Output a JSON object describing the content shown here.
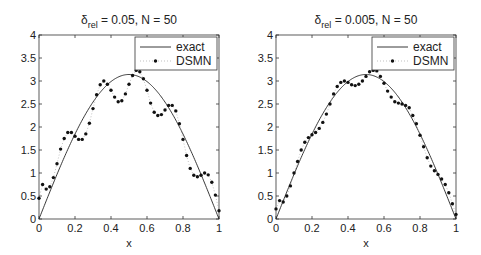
{
  "chart_data": [
    {
      "type": "line",
      "title": "δ_rel = 0.05, N = 50",
      "title_main": "δ",
      "title_sub": "rel",
      "title_rest": " = 0.05, N = 50",
      "xlabel": "x",
      "ylabel": "",
      "xlim": [
        0,
        1
      ],
      "ylim": [
        0,
        4
      ],
      "xticks": [
        "0",
        "0.2",
        "0.4",
        "0.6",
        "0.8",
        "1"
      ],
      "yticks": [
        "0",
        "0.5",
        "1",
        "1.5",
        "2",
        "2.5",
        "3",
        "3.5",
        "4"
      ],
      "grid": false,
      "legend": {
        "position": "upper right",
        "entries": [
          "exact",
          "DSMN"
        ]
      },
      "x": [
        0,
        0.02,
        0.04,
        0.06,
        0.08,
        0.1,
        0.12,
        0.14,
        0.16,
        0.18,
        0.2,
        0.22,
        0.24,
        0.26,
        0.28,
        0.3,
        0.32,
        0.34,
        0.36,
        0.38,
        0.4,
        0.42,
        0.44,
        0.46,
        0.48,
        0.5,
        0.52,
        0.54,
        0.56,
        0.58,
        0.6,
        0.62,
        0.64,
        0.66,
        0.68,
        0.7,
        0.72,
        0.74,
        0.76,
        0.78,
        0.8,
        0.82,
        0.84,
        0.86,
        0.88,
        0.9,
        0.92,
        0.94,
        0.96,
        0.98,
        1.0
      ],
      "series": [
        {
          "name": "exact",
          "style": "solid line",
          "function": "pi*sin(pi*x)",
          "peak": 3.14
        },
        {
          "name": "DSMN",
          "style": "dotted with dot markers",
          "values": [
            0.45,
            0.75,
            0.65,
            0.7,
            0.9,
            1.2,
            1.52,
            1.75,
            1.88,
            1.88,
            1.8,
            1.73,
            1.73,
            1.85,
            2.08,
            2.4,
            2.7,
            2.92,
            3.0,
            2.93,
            2.8,
            2.65,
            2.55,
            2.57,
            2.72,
            2.93,
            3.12,
            3.23,
            3.2,
            3.05,
            2.8,
            2.52,
            2.32,
            2.25,
            2.27,
            2.37,
            2.47,
            2.47,
            2.35,
            2.07,
            1.73,
            1.38,
            1.1,
            0.95,
            0.92,
            0.95,
            1.0,
            0.96,
            0.8,
            0.52,
            0.18
          ]
        }
      ]
    },
    {
      "type": "line",
      "title": "δ_rel = 0.005, N = 50",
      "title_main": "δ",
      "title_sub": "rel",
      "title_rest": " = 0.005, N = 50",
      "xlabel": "x",
      "ylabel": "",
      "xlim": [
        0,
        1
      ],
      "ylim": [
        0,
        4
      ],
      "xticks": [
        "0",
        "0.2",
        "0.4",
        "0.6",
        "0.8",
        "1"
      ],
      "yticks": [
        "0",
        "0.5",
        "1",
        "1.5",
        "2",
        "2.5",
        "3",
        "3.5",
        "4"
      ],
      "grid": false,
      "legend": {
        "position": "upper right",
        "entries": [
          "exact",
          "DSMN"
        ]
      },
      "x": [
        0,
        0.02,
        0.04,
        0.06,
        0.08,
        0.1,
        0.12,
        0.14,
        0.16,
        0.18,
        0.2,
        0.22,
        0.24,
        0.26,
        0.28,
        0.3,
        0.32,
        0.34,
        0.36,
        0.38,
        0.4,
        0.42,
        0.44,
        0.46,
        0.48,
        0.5,
        0.52,
        0.54,
        0.56,
        0.58,
        0.6,
        0.62,
        0.64,
        0.66,
        0.68,
        0.7,
        0.72,
        0.74,
        0.76,
        0.78,
        0.8,
        0.82,
        0.84,
        0.86,
        0.88,
        0.9,
        0.92,
        0.94,
        0.96,
        0.98,
        1.0
      ],
      "series": [
        {
          "name": "exact",
          "style": "solid line",
          "function": "pi*sin(pi*x)",
          "peak": 3.14
        },
        {
          "name": "DSMN",
          "style": "dotted with dot markers",
          "values": [
            0.22,
            0.4,
            0.37,
            0.5,
            0.72,
            1.0,
            1.25,
            1.5,
            1.67,
            1.77,
            1.83,
            1.88,
            1.97,
            2.1,
            2.28,
            2.5,
            2.72,
            2.88,
            2.97,
            3.0,
            2.97,
            2.92,
            2.9,
            2.93,
            3.0,
            3.1,
            3.2,
            3.23,
            3.22,
            3.1,
            2.95,
            2.78,
            2.65,
            2.55,
            2.52,
            2.5,
            2.47,
            2.42,
            2.25,
            2.07,
            1.82,
            1.57,
            1.33,
            1.15,
            1.05,
            0.97,
            0.87,
            0.75,
            0.57,
            0.33,
            0.1
          ]
        }
      ]
    }
  ]
}
